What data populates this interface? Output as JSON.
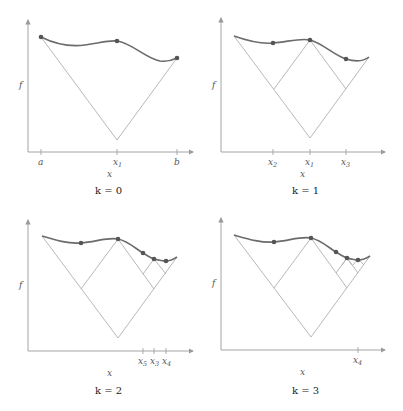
{
  "panels": [
    {
      "id": "k0",
      "caption": "k = 0",
      "ylabel": "f",
      "xlabel": "x",
      "ticks": [
        {
          "base": "a",
          "sub": ""
        },
        {
          "base": "x",
          "sub": "1"
        },
        {
          "base": "b",
          "sub": ""
        }
      ],
      "evaluated_points": [
        "a",
        "x1",
        "b"
      ]
    },
    {
      "id": "k1",
      "caption": "k = 1",
      "ylabel": "f",
      "xlabel": "x",
      "ticks": [
        {
          "base": "x",
          "sub": "2"
        },
        {
          "base": "x",
          "sub": "1"
        },
        {
          "base": "x",
          "sub": "3"
        }
      ],
      "evaluated_points": [
        "x2",
        "x1",
        "x3"
      ]
    },
    {
      "id": "k2",
      "caption": "k = 2",
      "ylabel": "f",
      "xlabel": "x",
      "ticks": [
        {
          "base": "x",
          "sub": "5"
        },
        {
          "base": "x",
          "sub": "3"
        },
        {
          "base": "x",
          "sub": "4"
        }
      ],
      "evaluated_points": [
        "x2",
        "x1",
        "x5",
        "x3",
        "x4"
      ]
    },
    {
      "id": "k3",
      "caption": "k = 3",
      "ylabel": "f",
      "xlabel": "x",
      "ticks": [
        {
          "base": "x",
          "sub": "4"
        }
      ],
      "evaluated_points": [
        "x2",
        "x1",
        "x5",
        "x3",
        "x4"
      ]
    }
  ],
  "colors": {
    "curve": "#6b6b6b",
    "points": "#555555",
    "lipschitz_lines": "#b0b0b0",
    "axes": "#9a9a9a"
  }
}
